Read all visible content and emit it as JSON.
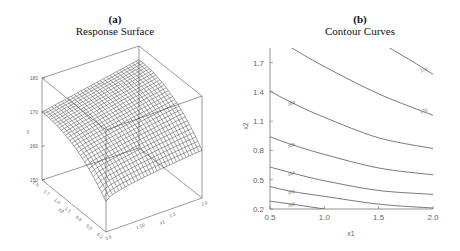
{
  "panels": {
    "a": {
      "tag": "(a)",
      "title": "Response Surface"
    },
    "b": {
      "tag": "(b)",
      "title": "Contour Curves"
    }
  },
  "chart_data": [
    {
      "type": "surface",
      "title": "(a) Response Surface",
      "xlabel": "x1",
      "ylabel": "x2",
      "zlabel": "y",
      "x1_ticks": [
        "0.5",
        "1.00",
        "1.5",
        "2.0"
      ],
      "x2_ticks": [
        "2.0",
        "1.7",
        "1.4",
        "1.1",
        "0.8",
        "0.5",
        "0.2"
      ],
      "z_ticks": [
        "150",
        "160",
        "170",
        "180"
      ],
      "x1_range": [
        0.5,
        2.0
      ],
      "x2_range": [
        0.2,
        2.0
      ],
      "z_range": [
        150,
        180
      ],
      "corner_z": {
        "x1_0.5_x2_2.0": 170,
        "x1_2.0_x2_2.0": 176,
        "x1_2.0_x2_0.2": 164,
        "x1_0.5_x2_0.2": 159
      },
      "grid": {
        "n_x1": 30,
        "n_x2": 30
      }
    },
    {
      "type": "contour",
      "title": "(b) Contour Curves",
      "xlabel": "x1",
      "ylabel": "x2",
      "xlim": [
        0.5,
        2.0
      ],
      "ylim": [
        0.2,
        1.85
      ],
      "x_ticks": [
        "0.5",
        "1.0",
        "1.5",
        "2.0"
      ],
      "y_ticks": [
        "0.2",
        "0.5",
        "0.8",
        "1.1",
        "1.4",
        "1.7"
      ],
      "contours": [
        {
          "level": "160",
          "points": [
            [
              0.5,
              0.28
            ],
            [
              0.7,
              0.25
            ],
            [
              1.0,
              0.2
            ]
          ]
        },
        {
          "level": "162",
          "points": [
            [
              0.5,
              0.43
            ],
            [
              0.7,
              0.38
            ],
            [
              1.0,
              0.33
            ],
            [
              1.5,
              0.25
            ],
            [
              2.0,
              0.21
            ]
          ]
        },
        {
          "level": "164",
          "points": [
            [
              0.5,
              0.63
            ],
            [
              0.7,
              0.57
            ],
            [
              1.0,
              0.49
            ],
            [
              1.5,
              0.39
            ],
            [
              2.0,
              0.35
            ]
          ]
        },
        {
          "level": "166",
          "points": [
            [
              0.5,
              0.94
            ],
            [
              0.7,
              0.86
            ],
            [
              1.0,
              0.76
            ],
            [
              1.5,
              0.62
            ],
            [
              2.0,
              0.55
            ]
          ]
        },
        {
          "level": "168",
          "points": [
            [
              0.5,
              1.41
            ],
            [
              0.7,
              1.29
            ],
            [
              1.0,
              1.14
            ],
            [
              1.5,
              0.93
            ],
            [
              2.0,
              0.82
            ]
          ]
        },
        {
          "level": "170",
          "points": [
            [
              0.7,
              1.85
            ],
            [
              1.0,
              1.66
            ],
            [
              1.5,
              1.38
            ],
            [
              2.0,
              1.16
            ]
          ]
        },
        {
          "level": "172",
          "points": [
            [
              1.6,
              1.85
            ],
            [
              1.8,
              1.72
            ],
            [
              2.0,
              1.58
            ]
          ]
        }
      ],
      "label_positions": [
        {
          "level": "160",
          "x1": 0.7,
          "x2": 0.25
        },
        {
          "level": "162",
          "x1": 0.7,
          "x2": 0.38
        },
        {
          "level": "164",
          "x1": 0.7,
          "x2": 0.57
        },
        {
          "level": "166",
          "x1": 0.7,
          "x2": 0.86
        },
        {
          "level": "168",
          "x1": 0.7,
          "x2": 1.29
        },
        {
          "level": "170",
          "x1": 1.92,
          "x2": 1.21
        },
        {
          "level": "172",
          "x1": 1.92,
          "x2": 1.63
        }
      ]
    }
  ]
}
